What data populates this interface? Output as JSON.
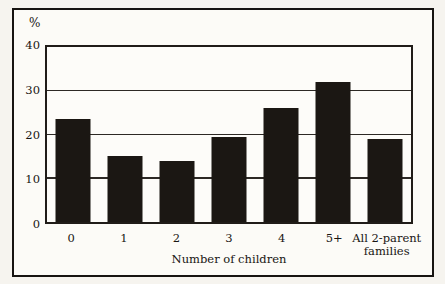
{
  "chart_data": {
    "type": "bar",
    "title": "",
    "ylabel": "%",
    "xlabel": "Number of children",
    "categories": [
      "0",
      "1",
      "2",
      "3",
      "4",
      "5+",
      "All 2-parent families"
    ],
    "values": [
      23.5,
      15,
      14,
      19.5,
      26,
      32,
      19
    ],
    "ylim": [
      0,
      40
    ],
    "yticks": [
      0,
      10,
      20,
      30,
      40
    ],
    "grid": true,
    "legend": "none",
    "bar_color": "#1b1713",
    "frame_color": "#171411",
    "background_color": "#fcfbf7"
  }
}
